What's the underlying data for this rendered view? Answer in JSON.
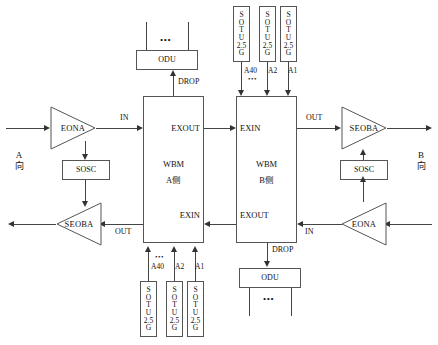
{
  "diagram": {
    "sides": {
      "left_direction": "A\n向",
      "left_direction_line1": "A",
      "left_direction_line2": "向",
      "right_direction_line1": "B",
      "right_direction_line2": "向"
    },
    "amplifiers": [
      {
        "id": "eona-left",
        "label": "EONA"
      },
      {
        "id": "seoba-left",
        "label": "SEOBA"
      },
      {
        "id": "seoba-right",
        "label": "SEOBA"
      },
      {
        "id": "eona-right",
        "label": "EONA"
      }
    ],
    "sosc": [
      {
        "id": "sosc-left",
        "label": "SOSC"
      },
      {
        "id": "sosc-right",
        "label": "SOSC"
      }
    ],
    "wbm": [
      {
        "id": "wbm-a",
        "title_line1": "WBM",
        "title_line2": "A侧",
        "port_top_right": "EXOUT",
        "port_bottom_right": "EXIN"
      },
      {
        "id": "wbm-b",
        "title_line1": "WBM",
        "title_line2": "B侧",
        "port_top_left": "EXIN",
        "port_bottom_left": "EXOUT"
      }
    ],
    "odu": [
      {
        "id": "odu-top",
        "label": "ODU",
        "dots": "•••"
      },
      {
        "id": "odu-bottom",
        "label": "ODU",
        "dots": "•••"
      }
    ],
    "sotu_box": {
      "letters": [
        "S",
        "O",
        "T",
        "U",
        "2.5",
        "G"
      ],
      "label": "SOTU 2.5G"
    },
    "sotu_groups": [
      {
        "id": "sotu-top-group",
        "channels": [
          "A40",
          "A2",
          "A1"
        ],
        "dots": "•••",
        "boxes": [
          {
            "letters": [
              "S",
              "O",
              "T",
              "U",
              "2.5",
              "G"
            ]
          },
          {
            "letters": [
              "S",
              "O",
              "T",
              "U",
              "2.5",
              "G"
            ]
          },
          {
            "letters": [
              "S",
              "O",
              "T",
              "U",
              "2.5",
              "G"
            ]
          }
        ]
      },
      {
        "id": "sotu-bottom-group",
        "channels": [
          "A40",
          "A2",
          "A1"
        ],
        "dots": "•••",
        "boxes": [
          {
            "letters": [
              "S",
              "O",
              "T",
              "U",
              "2.5",
              "G"
            ]
          },
          {
            "letters": [
              "S",
              "O",
              "T",
              "U",
              "2.5",
              "G"
            ]
          },
          {
            "letters": [
              "S",
              "O",
              "T",
              "U",
              "2.5",
              "G"
            ]
          }
        ]
      }
    ],
    "signal_labels": {
      "in_top": "IN",
      "out_top": "OUT",
      "out_bottom": "OUT",
      "in_bottom": "IN",
      "drop_top": "DROP",
      "drop_bottom": "DROP"
    },
    "colors": {
      "line": "#444444",
      "arrow": "#333333",
      "box_border": "#555555",
      "text": "#111111",
      "background": "#ffffff"
    }
  }
}
